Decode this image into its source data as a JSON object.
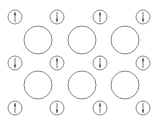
{
  "diagram": {
    "colors": {
      "background": "#ffffff",
      "stroke": "#7a7a7a",
      "arrow": "#555555"
    },
    "small_circle_radius": 7,
    "large_circle_radius": 14,
    "small_circles": [
      {
        "row": 0,
        "col": 0,
        "cx": 15,
        "cy": 17,
        "arrow": "up"
      },
      {
        "row": 0,
        "col": 1,
        "cx": 57,
        "cy": 17,
        "arrow": "down"
      },
      {
        "row": 0,
        "col": 2,
        "cx": 100,
        "cy": 17,
        "arrow": "up"
      },
      {
        "row": 0,
        "col": 3,
        "cx": 143,
        "cy": 17,
        "arrow": "down"
      },
      {
        "row": 1,
        "col": 0,
        "cx": 15,
        "cy": 63,
        "arrow": "down"
      },
      {
        "row": 1,
        "col": 1,
        "cx": 57,
        "cy": 63,
        "arrow": "up"
      },
      {
        "row": 1,
        "col": 2,
        "cx": 100,
        "cy": 63,
        "arrow": "down"
      },
      {
        "row": 1,
        "col": 3,
        "cx": 143,
        "cy": 63,
        "arrow": "up"
      },
      {
        "row": 2,
        "col": 0,
        "cx": 15,
        "cy": 108,
        "arrow": "up"
      },
      {
        "row": 2,
        "col": 1,
        "cx": 57,
        "cy": 108,
        "arrow": "down"
      },
      {
        "row": 2,
        "col": 2,
        "cx": 100,
        "cy": 108,
        "arrow": "up"
      },
      {
        "row": 2,
        "col": 3,
        "cx": 143,
        "cy": 108,
        "arrow": "down"
      }
    ],
    "large_circles": [
      {
        "row": 0,
        "col": 0,
        "cx": 38,
        "cy": 40
      },
      {
        "row": 0,
        "col": 1,
        "cx": 82,
        "cy": 40
      },
      {
        "row": 0,
        "col": 2,
        "cx": 125,
        "cy": 40
      },
      {
        "row": 1,
        "col": 0,
        "cx": 38,
        "cy": 85
      },
      {
        "row": 1,
        "col": 1,
        "cx": 82,
        "cy": 85
      },
      {
        "row": 1,
        "col": 2,
        "cx": 125,
        "cy": 85
      }
    ]
  }
}
